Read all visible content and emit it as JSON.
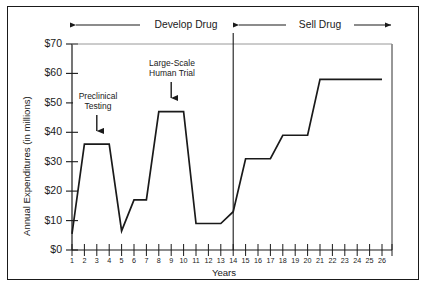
{
  "chart_data": {
    "type": "line",
    "title": "",
    "xlabel": "Years",
    "ylabel": "Annual Expenditures (in millions)",
    "x": [
      1,
      2,
      3,
      4,
      5,
      6,
      7,
      8,
      9,
      10,
      11,
      12,
      13,
      14,
      15,
      16,
      17,
      18,
      19,
      20,
      21,
      22,
      23,
      24,
      25,
      26
    ],
    "values": [
      5.5,
      36,
      36,
      36,
      6.5,
      17,
      17,
      47,
      47,
      47,
      9,
      9,
      9,
      13,
      31,
      31,
      31,
      39,
      39,
      39,
      58,
      58,
      58,
      58,
      58,
      58
    ],
    "series": [
      {
        "name": "Annual Expenditures",
        "values": [
          5.5,
          36,
          36,
          36,
          6.5,
          17,
          17,
          47,
          47,
          47,
          9,
          9,
          9,
          13,
          31,
          31,
          31,
          39,
          39,
          39,
          58,
          58,
          58,
          58,
          58,
          58
        ]
      }
    ],
    "xlim": [
      1,
      26
    ],
    "ylim": [
      0,
      70
    ],
    "ytick_values": [
      0,
      10,
      20,
      30,
      40,
      50,
      60,
      70
    ],
    "ytick_labels": [
      "$0",
      "$10",
      "$20",
      "$30",
      "$40",
      "$50",
      "$60",
      "$70"
    ],
    "xtick_values": [
      1,
      2,
      3,
      4,
      5,
      6,
      7,
      8,
      9,
      10,
      11,
      12,
      13,
      14,
      15,
      16,
      17,
      18,
      19,
      20,
      21,
      22,
      23,
      24,
      25,
      26
    ],
    "xtick_labels": [
      "1",
      "2",
      "3",
      "4",
      "5",
      "6",
      "7",
      "8",
      "9",
      "10",
      "11",
      "12",
      "13",
      "14",
      "15",
      "16",
      "17",
      "18",
      "19",
      "20",
      "21",
      "22",
      "23",
      "24",
      "25",
      "26"
    ],
    "grid": false,
    "legend_position": "none",
    "line_color": "#1a1a1a",
    "annotations": [
      {
        "label": "Preclinical\nTesting",
        "line1": "Preclinical",
        "line2": "Testing",
        "x": 3,
        "y": 36
      },
      {
        "label": "Large-Scale\nHuman Trial",
        "line1": "Large-Scale",
        "line2": "Human Trial",
        "x": 9,
        "y": 47
      }
    ],
    "phases": [
      {
        "label": "Develop Drug",
        "x_start": 1,
        "x_end": 13
      },
      {
        "label": "Sell Drug",
        "x_start": 13,
        "x_end": 26
      }
    ],
    "divider_x": 13
  },
  "labels": {
    "ylabel": "Annual Expenditures (in millions)",
    "xlabel": "Years",
    "phase_develop": "Develop Drug",
    "phase_sell": "Sell Drug",
    "annot1_line1": "Preclinical",
    "annot1_line2": "Testing",
    "annot2_line1": "Large-Scale",
    "annot2_line2": "Human Trial",
    "y0": "$0",
    "y10": "$10",
    "y20": "$20",
    "y30": "$30",
    "y40": "$40",
    "y50": "$50",
    "y60": "$60",
    "y70": "$70",
    "x1": "1",
    "x2": "2",
    "x3": "3",
    "x4": "4",
    "x5": "5",
    "x6": "6",
    "x7": "7",
    "x8": "8",
    "x9": "9",
    "x10": "10",
    "x11": "11",
    "x12": "12",
    "x13": "13",
    "x14": "14",
    "x15": "15",
    "x16": "16",
    "x17": "17",
    "x18": "18",
    "x19": "19",
    "x20": "20",
    "x21": "21",
    "x22": "22",
    "x23": "23",
    "x24": "24",
    "x25": "25",
    "x26": "26"
  },
  "colors": {
    "ink": "#1a1a1a",
    "background": "#ffffff"
  }
}
